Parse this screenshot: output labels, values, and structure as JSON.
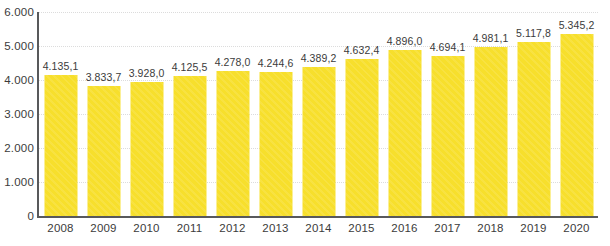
{
  "chart_data": {
    "type": "bar",
    "title": "",
    "subtitle": "",
    "xlabel": "",
    "ylabel": "",
    "categories": [
      "2008",
      "2009",
      "2010",
      "2011",
      "2012",
      "2013",
      "2014",
      "2015",
      "2016",
      "2017",
      "2018",
      "2019",
      "2020"
    ],
    "values": [
      4135.1,
      3833.7,
      3928.0,
      4125.5,
      4278.0,
      4244.6,
      4389.2,
      4632.4,
      4896.0,
      4694.1,
      4981.1,
      5117.8,
      5345.2
    ],
    "value_labels": [
      "4.135,1",
      "3.833,7",
      "3.928,0",
      "4.125,5",
      "4.278,0",
      "4.244,6",
      "4.389,2",
      "4.632,4",
      "4.896,0",
      "4.694,1",
      "4.981,1",
      "5.117,8",
      "5.345,2"
    ],
    "ylim": [
      0,
      6000
    ],
    "y_ticks": [
      0,
      1000,
      2000,
      3000,
      4000,
      5000,
      6000
    ],
    "y_tick_labels": [
      "0",
      "1.000",
      "2.000",
      "3.000",
      "4.000",
      "5.000",
      "6.000"
    ],
    "grid": true,
    "grid_style": "dotted-horizontal",
    "legend": null,
    "legend_position": "none",
    "series": [
      {
        "name": "",
        "values": [
          4135.1,
          3833.7,
          3928.0,
          4125.5,
          4278.0,
          4244.6,
          4389.2,
          4632.4,
          4896.0,
          4694.1,
          4981.1,
          5117.8,
          5345.2
        ]
      }
    ],
    "colors": {
      "bar": "#F7DF2C",
      "axis": "#58595B",
      "grid": "#DCDCDC",
      "text": "#3B3B3B",
      "background": "#FFFFFF"
    }
  }
}
